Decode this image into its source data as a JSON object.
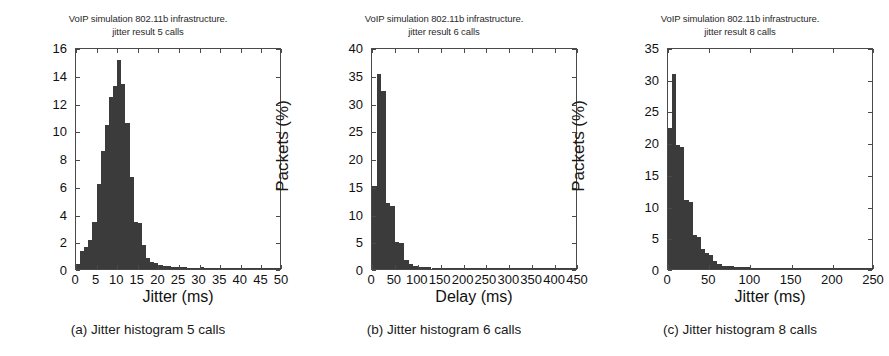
{
  "figure": {
    "panels": [
      {
        "caption": "(a) Jitter histogram 5 calls",
        "title_line1": "VoIP simulation 802.11b infrastructure.",
        "title_line2": "jitter result 5 calls",
        "chart_data": {
          "type": "bar",
          "title": "VoIP simulation 802.11b infrastructure. jitter result 5 calls",
          "xlabel": "Jitter (ms)",
          "ylabel": "Packets (%)",
          "xlim": [
            0,
            50
          ],
          "ylim": [
            0,
            16
          ],
          "xticks": [
            0,
            5,
            10,
            15,
            20,
            25,
            30,
            35,
            40,
            45,
            50
          ],
          "yticks": [
            0,
            2,
            4,
            6,
            8,
            10,
            12,
            14,
            16
          ],
          "grid": false,
          "legend": "none",
          "bin_width": 1,
          "bin_starts": [
            0,
            1,
            2,
            3,
            4,
            5,
            6,
            7,
            8,
            9,
            10,
            11,
            12,
            13,
            14,
            15,
            16,
            17,
            18,
            19,
            20,
            21,
            22,
            23,
            24,
            25,
            26,
            27,
            28,
            29,
            30,
            31,
            32,
            33,
            34,
            35,
            36,
            37,
            38,
            39,
            40,
            41,
            42,
            43,
            44,
            45,
            46,
            47,
            48,
            49
          ],
          "values": [
            0.35,
            1.3,
            1.6,
            2.1,
            3.4,
            6.1,
            8.5,
            10.4,
            12.4,
            13.2,
            15.1,
            13.3,
            10.5,
            6.6,
            3.4,
            3.3,
            1.7,
            0.8,
            0.5,
            0.4,
            0.3,
            0.22,
            0.2,
            0.18,
            0.15,
            0.14,
            0.12,
            0.1,
            0.1,
            0.09,
            0.12,
            0.08,
            0.07,
            0.07,
            0.06,
            0.06,
            0.05,
            0.05,
            0.05,
            0.05,
            0.04,
            0.04,
            0.04,
            0.03,
            0.03,
            0.03,
            0.03,
            0.03,
            0.08,
            0.03
          ]
        }
      },
      {
        "caption": "(b) Jitter histogram 6 calls",
        "title_line1": "VoIP simulation 802.11b infrastructure.",
        "title_line2": "jitter result 6 calls",
        "chart_data": {
          "type": "bar",
          "title": "VoIP simulation 802.11b infrastructure. jitter result 6 calls",
          "xlabel": "Delay (ms)",
          "ylabel": "Packets (%)",
          "xlim": [
            0,
            450
          ],
          "ylim": [
            0,
            40
          ],
          "xticks": [
            0,
            50,
            100,
            150,
            200,
            250,
            300,
            350,
            400,
            450
          ],
          "yticks": [
            0,
            5,
            10,
            15,
            20,
            25,
            30,
            35,
            40
          ],
          "grid": false,
          "legend": "none",
          "bin_width": 10,
          "bin_starts": [
            0,
            10,
            20,
            30,
            40,
            50,
            60,
            70,
            80,
            90,
            100,
            110,
            120,
            130,
            140,
            150,
            160,
            170,
            180,
            190,
            200,
            210,
            220,
            230,
            240,
            250,
            260,
            270,
            280,
            290,
            300,
            310,
            320,
            330,
            340,
            350,
            360,
            370,
            380,
            390,
            400,
            410,
            420,
            430,
            440
          ],
          "values": [
            15.0,
            35.1,
            32.0,
            11.9,
            11.3,
            4.9,
            4.6,
            1.6,
            0.9,
            0.6,
            0.45,
            0.35,
            0.3,
            0.22,
            0.18,
            0.16,
            0.14,
            0.12,
            0.12,
            0.1,
            0.1,
            0.09,
            0.09,
            0.08,
            0.08,
            0.07,
            0.07,
            0.06,
            0.06,
            0.06,
            0.05,
            0.05,
            0.05,
            0.05,
            0.04,
            0.04,
            0.04,
            0.04,
            0.04,
            0.03,
            0.03,
            0.03,
            0.12,
            0.03,
            0.03
          ]
        }
      },
      {
        "caption": "(c) Jitter histogram 8 calls",
        "title_line1": "VoIP simulation 802.11b infrastructure.",
        "title_line2": "jitter result 8 calls",
        "chart_data": {
          "type": "bar",
          "title": "VoIP simulation 802.11b infrastructure. jitter result 8 calls",
          "xlabel": "Jitter (ms)",
          "ylabel": "Packets (%)",
          "xlim": [
            0,
            250
          ],
          "ylim": [
            0,
            35
          ],
          "xticks": [
            0,
            50,
            100,
            150,
            200,
            250
          ],
          "yticks": [
            0,
            5,
            10,
            15,
            20,
            25,
            30,
            35
          ],
          "grid": false,
          "legend": "none",
          "bin_width": 5,
          "bin_starts": [
            0,
            5,
            10,
            15,
            20,
            25,
            30,
            35,
            40,
            45,
            50,
            55,
            60,
            65,
            70,
            75,
            80,
            85,
            90,
            95,
            100,
            105,
            110,
            115,
            120,
            125,
            130,
            135,
            140,
            145,
            150,
            155,
            160,
            165,
            170,
            175,
            180,
            185,
            190,
            195,
            200,
            205,
            210,
            215,
            220,
            225,
            230,
            235,
            240,
            245
          ],
          "values": [
            22.3,
            30.8,
            19.6,
            19.2,
            10.9,
            10.6,
            5.3,
            5.1,
            3.1,
            2.5,
            2.2,
            1.3,
            0.8,
            0.5,
            0.45,
            0.4,
            0.35,
            0.3,
            0.28,
            0.25,
            0.22,
            0.2,
            0.18,
            0.16,
            0.14,
            0.13,
            0.12,
            0.11,
            0.1,
            0.1,
            0.09,
            0.09,
            0.08,
            0.08,
            0.07,
            0.07,
            0.07,
            0.06,
            0.06,
            0.06,
            0.05,
            0.05,
            0.05,
            0.05,
            0.04,
            0.04,
            0.1,
            0.04,
            0.04,
            0.04
          ]
        }
      }
    ]
  },
  "style": {
    "bar_color": "#3b3b3b",
    "axis_color": "#4a4a4a",
    "background": "#ffffff"
  }
}
